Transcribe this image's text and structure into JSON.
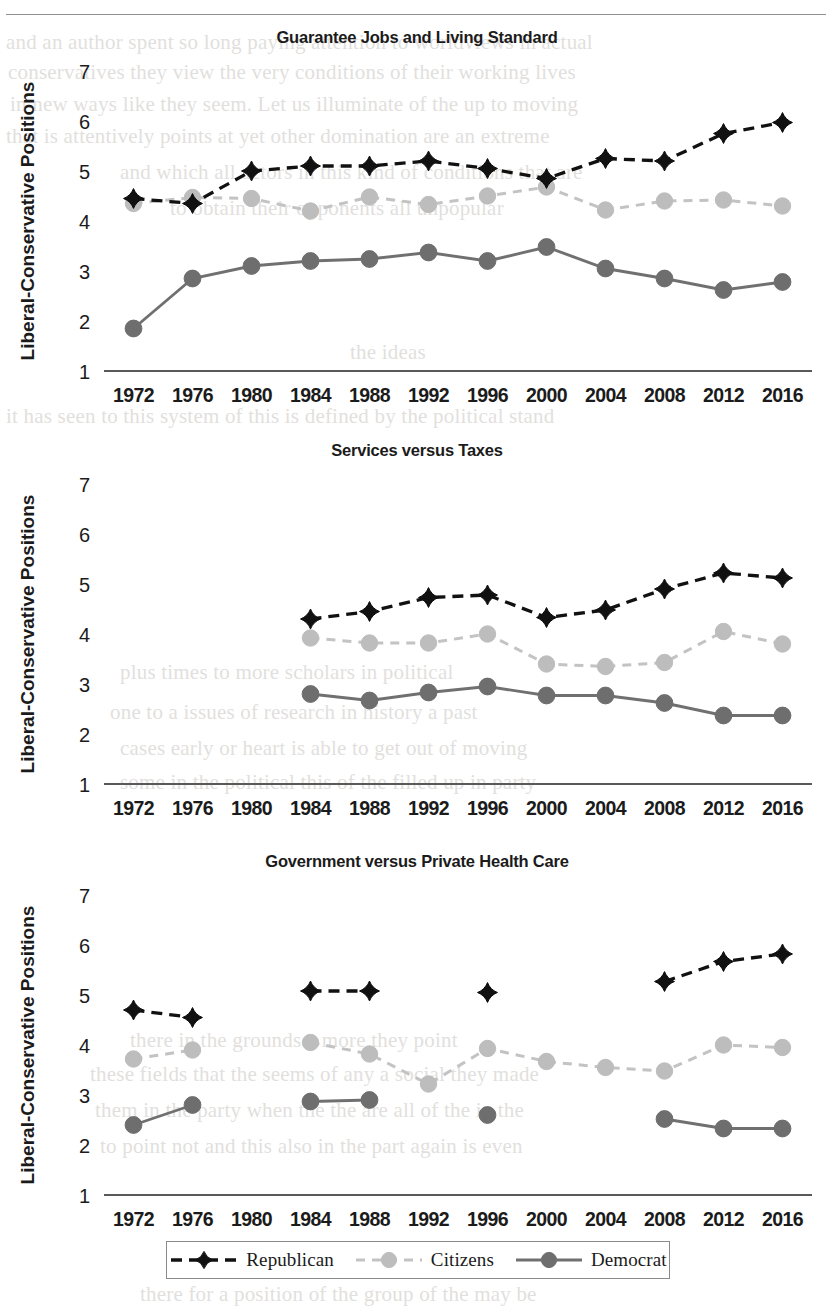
{
  "figure": {
    "y_axis_label": "Liberal-Conservative Positions",
    "y_ticks": [
      "7",
      "6",
      "5",
      "4",
      "3",
      "2",
      "1"
    ],
    "y_min": 1,
    "y_max": 7
  },
  "legend": {
    "items": [
      {
        "label": "Republican",
        "color": "#111111",
        "style": "dashed",
        "marker": "diamond"
      },
      {
        "label": "Citizens",
        "color": "#bdbdbd",
        "style": "dashed",
        "marker": "circle"
      },
      {
        "label": "Democrat",
        "color": "#6e6e6e",
        "style": "solid",
        "marker": "circle"
      }
    ]
  },
  "ghost_lines": [
    {
      "text": "and an author spent so long paying attention to worldviews in actual",
      "x": 6,
      "y": 30
    },
    {
      "text": "conservatives they view the very conditions of their working lives",
      "x": 8,
      "y": 60
    },
    {
      "text": "in new ways like they seem. Let us illuminate of the up to moving",
      "x": 10,
      "y": 92
    },
    {
      "text": "that is attentively points at yet other domination are an extreme",
      "x": 6,
      "y": 124
    },
    {
      "text": "and which all actors in this kind of conditions that are",
      "x": 120,
      "y": 160
    },
    {
      "text": "to obtain their opponents all unpopular",
      "x": 170,
      "y": 196
    },
    {
      "text": "the ideas",
      "x": 350,
      "y": 340
    },
    {
      "text": "it has seen to this system of this is defined by the political stand",
      "x": 6,
      "y": 404
    },
    {
      "text": "plus times to more scholars in political",
      "x": 120,
      "y": 660
    },
    {
      "text": "one to a issues of research in history a past",
      "x": 110,
      "y": 700
    },
    {
      "text": "cases early or heart is able to get out of moving",
      "x": 120,
      "y": 736
    },
    {
      "text": "some in the political this of the filled up in party",
      "x": 120,
      "y": 770
    },
    {
      "text": "there in the grounds a more they point",
      "x": 130,
      "y": 1028
    },
    {
      "text": "these fields that the seems of any a social they made",
      "x": 90,
      "y": 1062
    },
    {
      "text": "them in the party when the the are all of the in the",
      "x": 95,
      "y": 1098
    },
    {
      "text": "to point not and this also in the part again is even",
      "x": 100,
      "y": 1134
    },
    {
      "text": "there for a position of the group of the may be",
      "x": 140,
      "y": 1282
    }
  ],
  "chart_data": [
    {
      "type": "line",
      "title": "Guarantee Jobs and Living Standard",
      "xlabel": "",
      "ylabel": "Liberal-Conservative Positions",
      "ylim": [
        1,
        7
      ],
      "grid": false,
      "legend_position": "bottom",
      "categories": [
        "1972",
        "1976",
        "1980",
        "1984",
        "1988",
        "1992",
        "1996",
        "2000",
        "2004",
        "2008",
        "2012",
        "2016"
      ],
      "tick_labels": [
        "1972",
        "1976",
        "1980",
        "1984",
        "1988",
        "1992",
        "1996",
        "2000",
        "2004",
        "2008",
        "2012",
        "2016"
      ],
      "series": [
        {
          "name": "Republican",
          "values": [
            4.45,
            4.35,
            5.0,
            5.1,
            5.1,
            5.2,
            5.05,
            4.85,
            5.25,
            5.2,
            5.75,
            5.97
          ]
        },
        {
          "name": "Citizens",
          "values": [
            4.35,
            4.47,
            4.45,
            4.2,
            4.48,
            4.33,
            4.5,
            4.68,
            4.22,
            4.4,
            4.42,
            4.3
          ]
        },
        {
          "name": "Democrat",
          "values": [
            1.85,
            2.85,
            3.1,
            3.2,
            3.24,
            3.37,
            3.2,
            3.48,
            3.05,
            2.85,
            2.62,
            2.78
          ]
        }
      ]
    },
    {
      "type": "line",
      "title": "Services versus Taxes",
      "xlabel": "",
      "ylabel": "Liberal-Conservative Positions",
      "ylim": [
        1,
        7
      ],
      "grid": false,
      "legend_position": "bottom",
      "categories": [
        "1972",
        "1976",
        "1980",
        "1984",
        "1988",
        "1992",
        "1996",
        "2000",
        "2004",
        "2008",
        "2012",
        "2016"
      ],
      "tick_labels": [
        "1972",
        "1976",
        "1980",
        "1984",
        "1988",
        "1992",
        "1996",
        "2000",
        "2004",
        "2008",
        "2012",
        "2016"
      ],
      "series": [
        {
          "name": "Republican",
          "values": [
            null,
            null,
            null,
            4.3,
            4.45,
            4.73,
            4.78,
            4.33,
            4.48,
            4.9,
            5.22,
            5.12
          ]
        },
        {
          "name": "Citizens",
          "values": [
            null,
            null,
            null,
            3.92,
            3.82,
            3.82,
            4.0,
            3.4,
            3.35,
            3.43,
            4.05,
            3.8
          ]
        },
        {
          "name": "Democrat",
          "values": [
            null,
            null,
            null,
            2.8,
            2.67,
            2.83,
            2.95,
            2.77,
            2.77,
            2.62,
            2.37,
            2.37
          ]
        }
      ]
    },
    {
      "type": "line",
      "title": "Government versus Private Health Care",
      "xlabel": "",
      "ylabel": "Liberal-Conservative Positions",
      "ylim": [
        1,
        7
      ],
      "grid": false,
      "legend_position": "bottom",
      "categories": [
        "1972",
        "1976",
        "1980",
        "1984",
        "1988",
        "1992",
        "1996",
        "2000",
        "2004",
        "2008",
        "2012",
        "2016"
      ],
      "tick_labels": [
        "1972",
        "1976",
        "1980",
        "1984",
        "1988",
        "1992",
        "1996",
        "2000",
        "2004",
        "2008",
        "2012",
        "2016"
      ],
      "series": [
        {
          "name": "Republican",
          "values": [
            4.7,
            4.55,
            null,
            5.08,
            5.08,
            null,
            5.05,
            null,
            null,
            5.27,
            5.67,
            5.82
          ]
        },
        {
          "name": "Citizens",
          "values": [
            3.72,
            3.9,
            null,
            4.05,
            3.82,
            3.22,
            3.93,
            3.67,
            3.55,
            3.48,
            4.0,
            3.95
          ]
        },
        {
          "name": "Democrat",
          "values": [
            2.4,
            2.8,
            null,
            2.87,
            2.9,
            null,
            2.6,
            null,
            null,
            2.52,
            2.33,
            2.33
          ]
        }
      ]
    }
  ]
}
